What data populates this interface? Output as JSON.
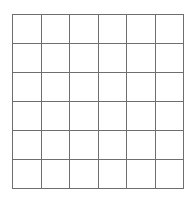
{
  "figure": {
    "kind": "empty-grid",
    "rows": 6,
    "columns": 6,
    "cell_count": 36,
    "line_color": "#6e6e6e",
    "background_color": "#ffffff",
    "cells": [
      [
        "",
        "",
        "",
        "",
        "",
        ""
      ],
      [
        "",
        "",
        "",
        "",
        "",
        ""
      ],
      [
        "",
        "",
        "",
        "",
        "",
        ""
      ],
      [
        "",
        "",
        "",
        "",
        "",
        ""
      ],
      [
        "",
        "",
        "",
        "",
        "",
        ""
      ],
      [
        "",
        "",
        "",
        "",
        "",
        ""
      ]
    ]
  }
}
